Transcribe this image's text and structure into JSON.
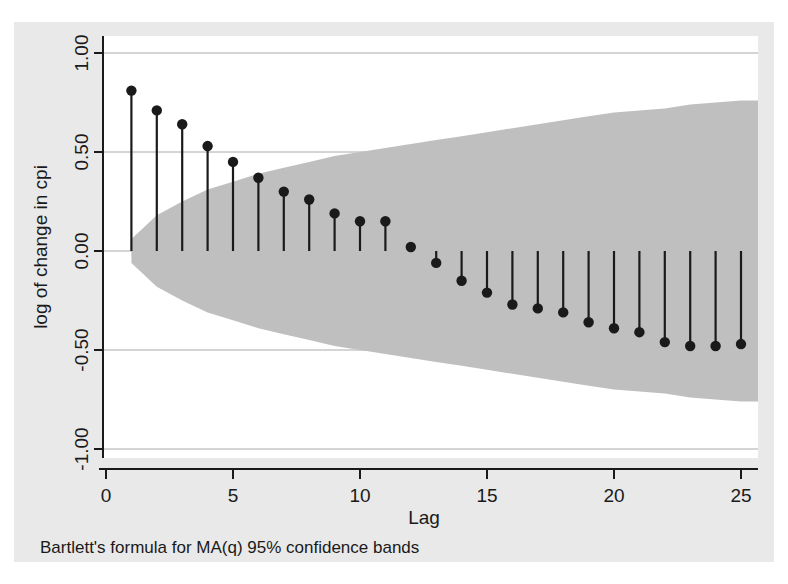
{
  "figure": {
    "background_color": "#e9e9e9",
    "plot_background_color": "#ffffff",
    "band_color": "#bfbfbf",
    "line_color": "#1a1a1a",
    "grid_color": "#aaaaaa",
    "axis_color": "#1a1a1a",
    "note": "Bartlett's formula for MA(q) 95% confidence bands"
  },
  "chart_data": {
    "type": "bar",
    "title": "",
    "subtitle": "",
    "xlabel": "Lag",
    "ylabel": "log of change in cpi",
    "annotation": "Bartlett's formula for MA(q) 95% confidence bands",
    "xlim": [
      -0.3,
      25.8
    ],
    "ylim": [
      -1.15,
      1.12
    ],
    "xticks": [
      0,
      5,
      10,
      15,
      20,
      25
    ],
    "xtick_labels": [
      "0",
      "5",
      "10",
      "15",
      "20",
      "25"
    ],
    "yticks": [
      1.0,
      0.5,
      0.0,
      -0.5,
      -1.0
    ],
    "ytick_labels": [
      "1.00",
      "0.50",
      "0.00",
      "-0.50",
      "-1.00"
    ],
    "grid": true,
    "legend": "none",
    "marker": "filled-circle",
    "categories": [
      1,
      2,
      3,
      4,
      5,
      6,
      7,
      8,
      9,
      10,
      11,
      12,
      13,
      14,
      15,
      16,
      17,
      18,
      19,
      20,
      21,
      22,
      23,
      24,
      25
    ],
    "values": [
      0.81,
      0.71,
      0.64,
      0.53,
      0.45,
      0.37,
      0.3,
      0.26,
      0.19,
      0.15,
      0.15,
      0.02,
      -0.06,
      -0.15,
      -0.21,
      -0.27,
      -0.29,
      -0.31,
      -0.36,
      -0.39,
      -0.41,
      -0.46,
      -0.48,
      -0.48,
      -0.47
    ],
    "series": [
      {
        "name": "autocorrelation",
        "values": [
          0.81,
          0.71,
          0.64,
          0.53,
          0.45,
          0.37,
          0.3,
          0.26,
          0.19,
          0.15,
          0.15,
          0.02,
          -0.06,
          -0.15,
          -0.21,
          -0.27,
          -0.29,
          -0.31,
          -0.36,
          -0.39,
          -0.41,
          -0.46,
          -0.48,
          -0.48,
          -0.47
        ]
      },
      {
        "name": "confidence-band-upper",
        "values": [
          0.06,
          0.18,
          0.25,
          0.31,
          0.35,
          0.39,
          0.42,
          0.45,
          0.48,
          0.5,
          0.52,
          0.54,
          0.56,
          0.58,
          0.6,
          0.62,
          0.64,
          0.66,
          0.68,
          0.7,
          0.71,
          0.72,
          0.74,
          0.75,
          0.76
        ]
      },
      {
        "name": "confidence-band-lower",
        "values": [
          -0.06,
          -0.18,
          -0.25,
          -0.31,
          -0.35,
          -0.39,
          -0.42,
          -0.45,
          -0.48,
          -0.5,
          -0.52,
          -0.54,
          -0.56,
          -0.58,
          -0.6,
          -0.62,
          -0.64,
          -0.66,
          -0.68,
          -0.7,
          -0.71,
          -0.72,
          -0.74,
          -0.75,
          -0.76
        ]
      }
    ]
  }
}
